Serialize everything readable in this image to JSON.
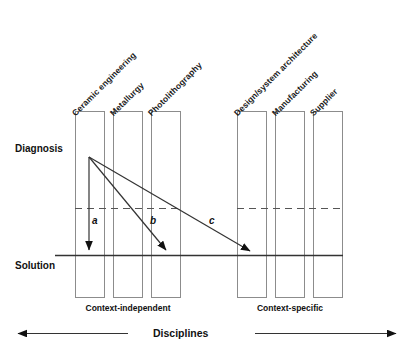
{
  "diagram": {
    "title": "Disciplines",
    "vertical_axis": {
      "top_label": "Diagnosis",
      "bottom_label": "Solution"
    },
    "groups": [
      {
        "name": "Context-independent",
        "label": "Context-independent"
      },
      {
        "name": "Context-specific",
        "label": "Context-specific"
      }
    ],
    "columns": [
      {
        "label": "Ceramic engineering",
        "group": "Context-independent"
      },
      {
        "label": "Metallurgy",
        "group": "Context-independent"
      },
      {
        "label": "Photolithography",
        "group": "Context-independent"
      },
      {
        "label": "Design/system architecture",
        "group": "Context-specific"
      },
      {
        "label": "Manufacturing",
        "group": "Context-specific"
      },
      {
        "label": "Supplier",
        "group": "Context-specific"
      }
    ],
    "arrows": [
      {
        "letter": "a",
        "from_column": "Ceramic engineering",
        "to_column": "Ceramic engineering"
      },
      {
        "letter": "b",
        "from_column": "Ceramic engineering",
        "to_column": "Photolithography"
      },
      {
        "letter": "c",
        "from_column": "Ceramic engineering",
        "to_column": "Design/system architecture"
      }
    ],
    "colors": {
      "line": "#4d4d4d",
      "box_stroke": "#808080",
      "solid_line": "#333333",
      "text": "#111111",
      "background": "#ffffff"
    }
  }
}
